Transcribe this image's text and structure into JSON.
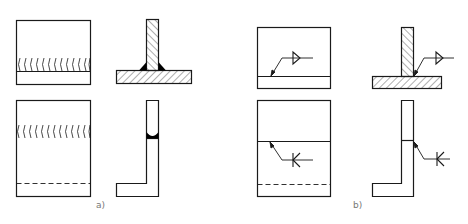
{
  "figure": {
    "panels": [
      {
        "id": "a",
        "label": "a)",
        "description": "T-joint and corner joint with fillet welds shown by weld seam arcs and black filled weld sections"
      },
      {
        "id": "b",
        "label": "b)",
        "description": "T-joint and corner joint with weld symbols on leader lines (fillet triangle and K-bevel symbol)"
      }
    ],
    "symbols": {
      "fillet": "fillet-weld-triangle-icon",
      "k_groove": "K",
      "leader_arrow": "arrow-icon"
    },
    "colors": {
      "line": "#1a1a1a",
      "hatch": "#333333",
      "weld_fill": "#000000",
      "label": "#777777",
      "background": "#ffffff"
    }
  }
}
